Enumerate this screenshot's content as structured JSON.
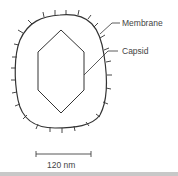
{
  "diagram": {
    "labels": {
      "membrane": "Membrane",
      "capsid": "Capsid",
      "scale": "120 nm"
    },
    "colors": {
      "line": "#333333",
      "text": "#444444"
    }
  }
}
